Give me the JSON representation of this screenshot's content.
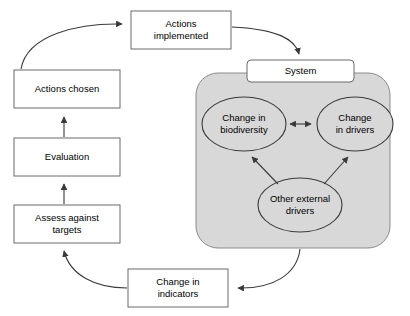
{
  "diagram": {
    "colors": {
      "background": "#ffffff",
      "box_fill": "#ffffff",
      "box_stroke": "#6a6a6a",
      "system_panel_fill": "#d8d8d8",
      "system_panel_stroke": "#8a8a8a",
      "ellipse_fill": "#d8d8d8",
      "ellipse_stroke": "#3a3a3a",
      "arrow_stroke": "#3a3a3a",
      "text": "#000000"
    },
    "boxes": [
      {
        "id": "actions-implemented",
        "label": "Actions\nimplemented",
        "x": 131,
        "y": 11,
        "width": 100,
        "height": 38,
        "rounded": false
      },
      {
        "id": "actions-chosen",
        "label": "Actions chosen",
        "x": 14,
        "y": 70,
        "width": 106,
        "height": 38,
        "rounded": false
      },
      {
        "id": "evaluation",
        "label": "Evaluation",
        "x": 14,
        "y": 138,
        "width": 106,
        "height": 38,
        "rounded": false
      },
      {
        "id": "assess-against-targets",
        "label": "Assess against\ntargets",
        "x": 14,
        "y": 205,
        "width": 106,
        "height": 38,
        "rounded": false
      },
      {
        "id": "change-in-indicators",
        "label": "Change in\nindicators",
        "x": 128,
        "y": 269,
        "width": 100,
        "height": 38,
        "rounded": false
      },
      {
        "id": "system",
        "label": "System",
        "x": 247,
        "y": 60,
        "width": 107,
        "height": 22,
        "rounded": true
      }
    ],
    "system_panel": {
      "id": "system-panel",
      "label": "System boundary",
      "x": 196,
      "y": 73,
      "width": 194,
      "height": 175,
      "corner_radius": 22
    },
    "ellipses": [
      {
        "id": "change-in-biodiversity",
        "label": "Change in\nbiodiversity",
        "cx": 244,
        "cy": 124,
        "rx": 42,
        "ry": 27
      },
      {
        "id": "change-in-drivers",
        "label": "Change\nin drivers",
        "cx": 355,
        "cy": 124,
        "rx": 38,
        "ry": 27
      },
      {
        "id": "other-external-drivers",
        "label": "Other external\ndrivers",
        "cx": 300,
        "cy": 205,
        "rx": 42,
        "ry": 27
      }
    ],
    "connectors": [
      {
        "id": "actions-chosen-to-actions-implemented",
        "from": "actions-chosen",
        "to": "actions-implemented",
        "style": "curved",
        "arrowheads": "end"
      },
      {
        "id": "actions-implemented-to-system",
        "from": "actions-implemented",
        "to": "system",
        "style": "curved",
        "arrowheads": "end"
      },
      {
        "id": "system-to-change-in-indicators",
        "from": "system-panel",
        "to": "change-in-indicators",
        "style": "curved",
        "arrowheads": "end"
      },
      {
        "id": "change-in-indicators-to-assess-against-targets",
        "from": "change-in-indicators",
        "to": "assess-against-targets",
        "style": "curved",
        "arrowheads": "end"
      },
      {
        "id": "assess-against-targets-to-evaluation",
        "from": "assess-against-targets",
        "to": "evaluation",
        "style": "straight",
        "arrowheads": "end"
      },
      {
        "id": "evaluation-to-actions-chosen",
        "from": "evaluation",
        "to": "actions-chosen",
        "style": "straight",
        "arrowheads": "end"
      },
      {
        "id": "biodiversity-drivers-bidirectional",
        "from": "change-in-biodiversity",
        "to": "change-in-drivers",
        "style": "straight",
        "arrowheads": "both"
      },
      {
        "id": "other-drivers-to-biodiversity",
        "from": "other-external-drivers",
        "to": "change-in-biodiversity",
        "style": "straight",
        "arrowheads": "end"
      },
      {
        "id": "other-drivers-to-change-in-drivers",
        "from": "other-external-drivers",
        "to": "change-in-drivers",
        "style": "straight",
        "arrowheads": "end"
      }
    ]
  }
}
